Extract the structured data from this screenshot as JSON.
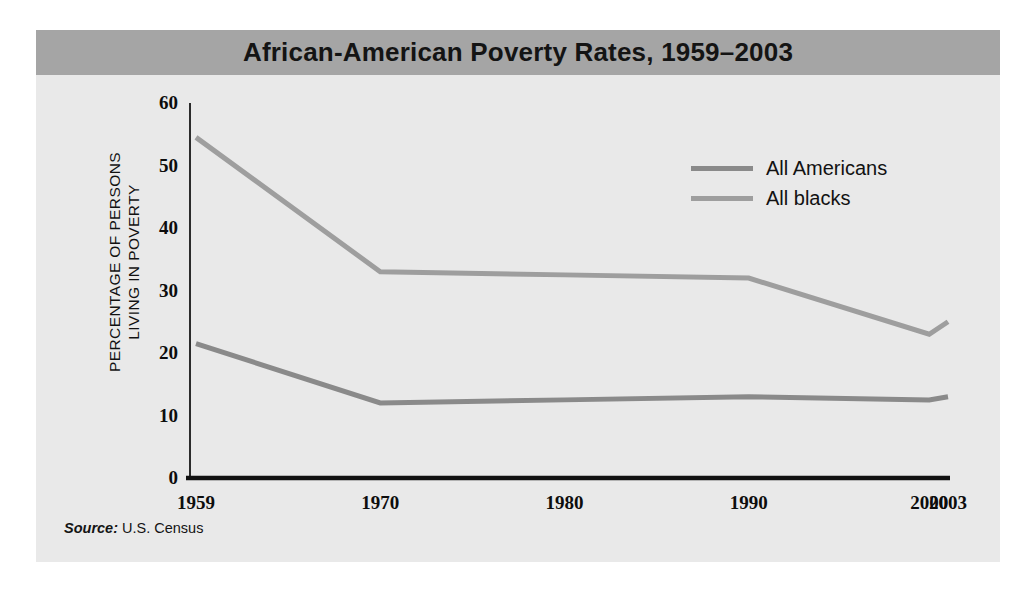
{
  "figure": {
    "title": "African-American Poverty Rates, 1959–2003",
    "panel_bg": "#e9e9e9",
    "title_band_bg": "#a5a5a5",
    "page_bg": "#ffffff"
  },
  "axes": {
    "y_caption_line1": "PERCENTAGE OF PERSONS",
    "y_caption_line2": "LIVING IN POVERTY",
    "y_caption": "PERCENTAGE OF PERSONS\nLIVING IN POVERTY",
    "y_ticks": [
      "0",
      "10",
      "20",
      "30",
      "40",
      "50",
      "60"
    ],
    "x_ticks": [
      "1959",
      "1970",
      "1980",
      "1990",
      "2000",
      "2003"
    ],
    "axis_color": "#111111"
  },
  "legend": {
    "position": "top-right",
    "entries": [
      {
        "label": "All Americans",
        "color": "#8a8a8a"
      },
      {
        "label": "All blacks",
        "color": "#9e9e9e"
      }
    ]
  },
  "source": {
    "label": "Source:",
    "value": "U.S. Census"
  },
  "chart_data": {
    "type": "line",
    "title": "African-American Poverty Rates, 1959–2003",
    "xlabel": "",
    "ylabel": "PERCENTAGE OF PERSONS LIVING IN POVERTY",
    "x": [
      1959,
      1970,
      1980,
      1990,
      2000,
      2003
    ],
    "categories": [
      "1959",
      "1970",
      "1980",
      "1990",
      "2000",
      "2003"
    ],
    "ylim": [
      0,
      60
    ],
    "yticks": [
      0,
      10,
      20,
      30,
      40,
      50,
      60
    ],
    "grid": false,
    "legend_position": "top-right",
    "series": [
      {
        "name": "All Americans",
        "color": "#8a8a8a",
        "values": [
          21.5,
          12,
          12.5,
          13,
          12.5,
          13
        ]
      },
      {
        "name": "All blacks",
        "color": "#9e9e9e",
        "values": [
          54.5,
          33,
          32.5,
          32,
          23,
          25
        ]
      }
    ],
    "source": "Source: U.S. Census"
  }
}
